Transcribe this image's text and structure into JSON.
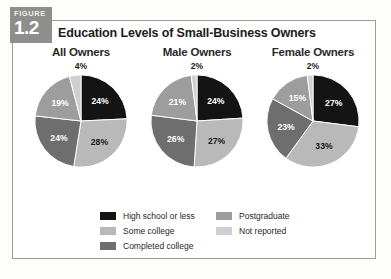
{
  "figure": {
    "badge_word": "FIGURE",
    "badge_number": "1.2",
    "title": "Education Levels of Small-Business Owners"
  },
  "legend": {
    "left_items": [
      {
        "label": "High school or less",
        "color": "#141414"
      },
      {
        "label": "Some college",
        "color": "#b9b9b9"
      },
      {
        "label": "Completed college",
        "color": "#6e6e6e"
      }
    ],
    "right_items": [
      {
        "label": "Postgraduate",
        "color": "#9d9d9d"
      },
      {
        "label": "Not reported",
        "color": "#cfcfcf"
      }
    ]
  },
  "chart_data": [
    {
      "type": "pie",
      "title": "All Owners",
      "top_callout": "4%",
      "categories": [
        "High school or less",
        "Some college",
        "Completed college",
        "Postgraduate",
        "Not reported"
      ],
      "values": [
        24,
        28,
        24,
        19,
        4
      ],
      "labels": [
        "24%",
        "28%",
        "24%",
        "19%",
        "4%"
      ],
      "colors": [
        "#141414",
        "#b9b9b9",
        "#6e6e6e",
        "#9d9d9d",
        "#cfcfcf"
      ],
      "label_colors": [
        "#ffffff",
        "#1a1a1a",
        "#ffffff",
        "#ffffff",
        "#1a1a1a"
      ],
      "start_angle": 0,
      "legend_position": "bottom"
    },
    {
      "type": "pie",
      "title": "Male Owners",
      "top_callout": "2%",
      "categories": [
        "High school or less",
        "Some college",
        "Completed college",
        "Postgraduate",
        "Not reported"
      ],
      "values": [
        24,
        27,
        26,
        21,
        2
      ],
      "labels": [
        "24%",
        "27%",
        "26%",
        "21%",
        "2%"
      ],
      "colors": [
        "#141414",
        "#b9b9b9",
        "#6e6e6e",
        "#9d9d9d",
        "#cfcfcf"
      ],
      "label_colors": [
        "#ffffff",
        "#1a1a1a",
        "#ffffff",
        "#ffffff",
        "#1a1a1a"
      ],
      "start_angle": 0,
      "legend_position": "bottom"
    },
    {
      "type": "pie",
      "title": "Female Owners",
      "top_callout": "2%",
      "categories": [
        "High school or less",
        "Some college",
        "Completed college",
        "Postgraduate",
        "Not reported"
      ],
      "values": [
        27,
        33,
        23,
        15,
        2
      ],
      "labels": [
        "27%",
        "33%",
        "23%",
        "15%",
        "2%"
      ],
      "colors": [
        "#141414",
        "#b9b9b9",
        "#6e6e6e",
        "#9d9d9d",
        "#cfcfcf"
      ],
      "label_colors": [
        "#ffffff",
        "#1a1a1a",
        "#ffffff",
        "#ffffff",
        "#1a1a1a"
      ],
      "start_angle": 0,
      "legend_position": "bottom"
    }
  ]
}
